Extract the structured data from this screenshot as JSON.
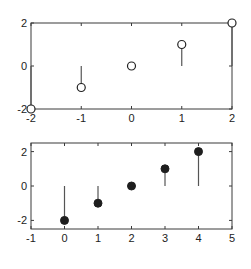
{
  "chart_data": [
    {
      "type": "stem",
      "title": "",
      "xlabel": "",
      "ylabel": "",
      "xlim": [
        -2,
        2
      ],
      "ylim": [
        -2,
        2
      ],
      "xticks": [
        -2,
        -1,
        0,
        1,
        2
      ],
      "yticks": [
        -2,
        0,
        2
      ],
      "xtick_labels": [
        "-2",
        "-1",
        "0",
        "1",
        "2"
      ],
      "ytick_labels": [
        "-2",
        "0",
        "2"
      ],
      "marker": "open-circle",
      "baseline": 0,
      "x": [
        -2,
        -1,
        0,
        1,
        2
      ],
      "y": [
        -2,
        -1,
        0,
        1,
        2
      ],
      "grid": false
    },
    {
      "type": "stem",
      "title": "",
      "xlabel": "",
      "ylabel": "",
      "xlim": [
        -1,
        5
      ],
      "ylim": [
        -2.5,
        2.5
      ],
      "xticks": [
        -1,
        0,
        1,
        2,
        3,
        4,
        5
      ],
      "yticks": [
        -2,
        0,
        2
      ],
      "xtick_labels": [
        "-1",
        "0",
        "1",
        "2",
        "3",
        "4",
        "5"
      ],
      "ytick_labels": [
        "-2",
        "0",
        "2"
      ],
      "marker": "filled-circle",
      "baseline": 0,
      "x": [
        0,
        1,
        2,
        3,
        4
      ],
      "y": [
        -2,
        -1,
        0,
        1,
        2
      ],
      "grid": false
    }
  ]
}
